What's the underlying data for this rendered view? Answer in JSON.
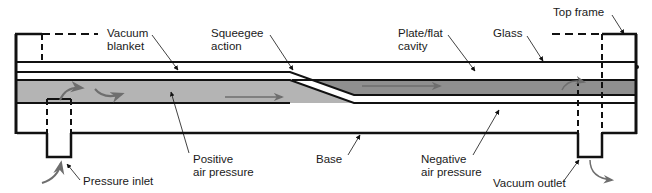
{
  "diagram": {
    "colors": {
      "outline": "#111111",
      "positive_fill": "#b4b4b4",
      "negative_fill": "#8f8f8f",
      "flow_arrow": "#6e6e6e",
      "background": "#ffffff"
    },
    "labels": {
      "vacuum_blanket": [
        "Vacuum",
        "blanket"
      ],
      "squeegee_action": [
        "Squeegee",
        "action"
      ],
      "plate_cavity": [
        "Plate/flat",
        "cavity"
      ],
      "glass": "Glass",
      "top_frame": "Top frame",
      "positive_air_pressure": [
        "Positive",
        "air pressure"
      ],
      "base": "Base",
      "negative_air_pressure": [
        "Negative",
        "air pressure"
      ],
      "pressure_inlet": "Pressure inlet",
      "vacuum_outlet": "Vacuum outlet"
    }
  }
}
